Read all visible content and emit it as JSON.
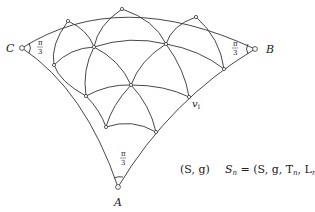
{
  "labels": {
    "A": "A",
    "B": "B",
    "C": "C",
    "vi": "v",
    "vi_sub": "i"
  },
  "angles": {
    "C": {
      "num": "π",
      "den": "3"
    },
    "B": {
      "num": "π",
      "den": "3"
    },
    "A": {
      "num": "π",
      "den": "3"
    }
  },
  "formulas": {
    "surface": "(S, g)",
    "sn_left": "S",
    "sn_sub": "n",
    "sn_right": " = (S, g, T",
    "t_sub": "n",
    "l_part": ", L",
    "l_sub": "n",
    "close": ")"
  },
  "colors": {
    "stroke": "#333333",
    "background": "#ffffff"
  }
}
